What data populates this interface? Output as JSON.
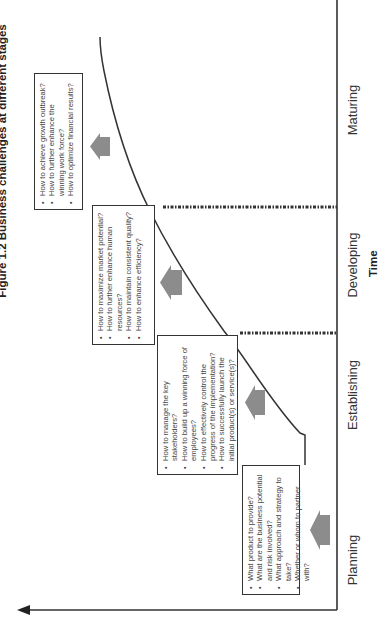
{
  "title": "Figure 1.2  Business challenges at different stages",
  "axes": {
    "x_label": "Time",
    "y_label": "Business cycle"
  },
  "stages": [
    {
      "label": "Planning",
      "challenges": [
        "What product to provide?",
        "What are the business potential and risk involved?",
        "What approach and strategy to take?",
        "Whether or whom to partner with?"
      ]
    },
    {
      "label": "Establishing",
      "challenges": [
        "How to manage the key stakeholders?",
        "How to build up a winning force of employees?",
        "How to effectively control the progress of the implementation?",
        "How to successfully launch the initial product(s) or service(s)?"
      ]
    },
    {
      "label": "Developing",
      "challenges": [
        "How to maximize market potential?",
        "How to further enhance human resources?",
        "How to maintain consistent quality?",
        "How to enhance efficiency?"
      ]
    },
    {
      "label": "Maturing",
      "challenges": [
        "How to achieve growth outbreak?",
        "How to further enhance the winning work force?",
        "How to optimize financial results?"
      ]
    }
  ],
  "colors": {
    "line": "#333333",
    "arrow_fill": "#8c8c8c",
    "box_border": "#333333",
    "text": "#444444"
  }
}
